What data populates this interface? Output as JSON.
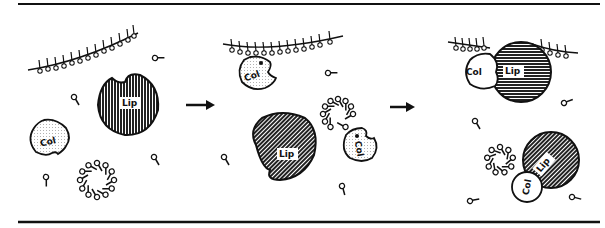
{
  "diagram": {
    "type": "mechanism schematic",
    "panels": [
      {
        "id": "panel-1",
        "description": "Free colipase, lipase, micelle and bile-salt monomers near lipid interface",
        "labels": [
          "Lip",
          "Col"
        ]
      },
      {
        "id": "panel-2",
        "description": "Colipase binds the interface; another colipase binds a micelle; lipase free",
        "labels": [
          "Col",
          "Lip",
          "Col"
        ]
      },
      {
        "id": "panel-3",
        "description": "Lipase-colipase complex at the interface and lipase-colipase-micelle complex",
        "labels": [
          "Col",
          "Lip",
          "Lip",
          "Col"
        ]
      }
    ],
    "arrows": [
      {
        "from": "panel-1",
        "to": "panel-2"
      },
      {
        "from": "panel-2",
        "to": "panel-3"
      }
    ],
    "legend": {
      "lipase": "Lip",
      "colipase": "Col"
    },
    "colors": {
      "ink": "#111111",
      "background": "#ffffff",
      "colipase_fill": "#f2f2f2"
    }
  }
}
